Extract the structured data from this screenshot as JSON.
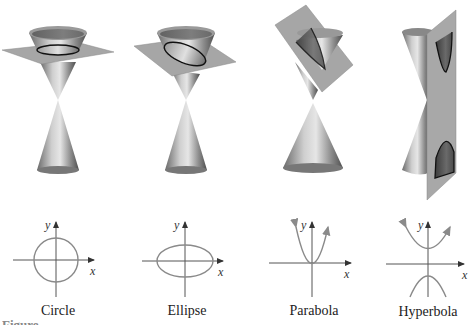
{
  "figure": {
    "panels": [
      {
        "name": "circle",
        "label": "Circle",
        "axis_x": "x",
        "axis_y": "y"
      },
      {
        "name": "ellipse",
        "label": "Ellipse",
        "axis_x": "x",
        "axis_y": "y"
      },
      {
        "name": "parabola",
        "label": "Parabola",
        "axis_x": "x",
        "axis_y": "y"
      },
      {
        "name": "hyperbola",
        "label": "Hyperbola",
        "axis_x": "x",
        "axis_y": "y"
      }
    ],
    "caption": "Figure"
  },
  "colors": {
    "cone_dark": "#555555",
    "cone_light": "#d8d8d8",
    "plane": "#a6a6a6",
    "curve": "#8a8a8a",
    "axis": "#555555"
  }
}
